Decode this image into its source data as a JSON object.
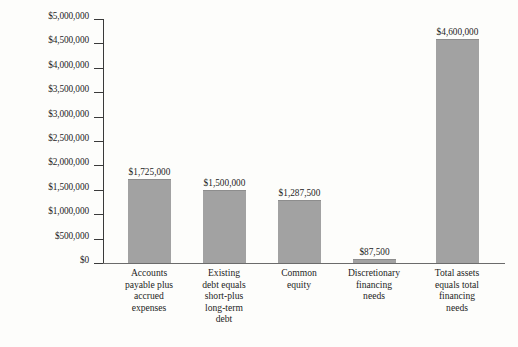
{
  "chart_data": {
    "type": "bar",
    "title": "",
    "subtitle": "",
    "xlabel": "",
    "ylabel": "",
    "ylim": [
      0,
      5000000
    ],
    "grid": false,
    "legend": null,
    "categories": [
      "Accounts payable plus accrued expenses",
      "Existing debt equals short-plus long-term debt",
      "Common equity",
      "Discretionary financing needs",
      "Total assets equals total financing needs"
    ],
    "category_lines": [
      [
        "Accounts",
        "payable plus",
        "accrued",
        "expenses"
      ],
      [
        "Existing",
        "debt equals",
        "short-plus",
        "long-term",
        "debt"
      ],
      [
        "Common",
        "equity"
      ],
      [
        "Discretionary",
        "financing",
        "needs"
      ],
      [
        "Total assets",
        "equals total",
        "financing",
        "needs"
      ]
    ],
    "values": [
      1725000,
      1500000,
      1287500,
      87500,
      4600000
    ],
    "value_labels": [
      "$1,725,000",
      "$1,500,000",
      "$1,287,500",
      "$87,500",
      "$4,600,000"
    ],
    "y_ticks": [
      0,
      500000,
      1000000,
      1500000,
      2000000,
      2500000,
      3000000,
      3500000,
      4000000,
      4500000,
      5000000
    ],
    "y_tick_labels": [
      "$0",
      "$500,000",
      "$1,000,000",
      "$1,500,000",
      "$2,000,000",
      "$2,500,000",
      "$3,000,000",
      "$3,500,000",
      "$4,000,000",
      "$4,500,000",
      "$5,000,000"
    ],
    "colors": {
      "bar_fill": "#a2a2a2",
      "bar_edge": "#8d8d8d",
      "axis": "#3a3a3a",
      "text": "#1d1d1d",
      "background": "#fdfdfb"
    }
  }
}
